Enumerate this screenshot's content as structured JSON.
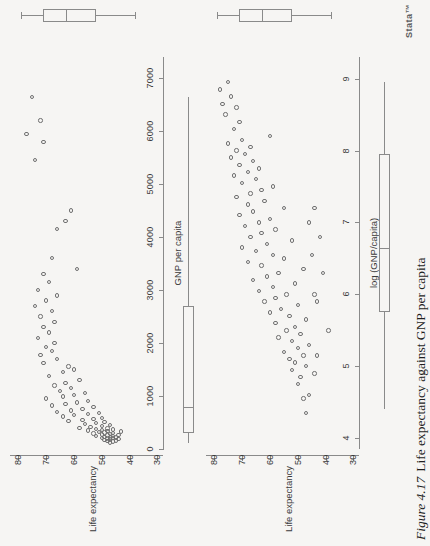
{
  "figure": {
    "number": "Figure 4.17",
    "caption": "Life expectancy against GNP per capita",
    "watermark": "Stata™",
    "orientation": "rotated-90-ccw",
    "background_color": "#f6f5f3",
    "ink_color": "#707070"
  },
  "chart_data": [
    {
      "id": "panel-raw",
      "type": "scatter",
      "title": "",
      "xlabel": "GNP per capita",
      "ylabel": "Life expectancy",
      "xlim": [
        0,
        7400
      ],
      "ylim": [
        28,
        83
      ],
      "xticks": [
        0,
        1000,
        2000,
        3000,
        4000,
        5000,
        6000,
        7000
      ],
      "xticklabels": [
        "0",
        "1000",
        "2000",
        "3000",
        "4000",
        "5000",
        "6000",
        "7000"
      ],
      "yticks": [
        30,
        40,
        50,
        60,
        70,
        80
      ],
      "yticklabels": [
        "30",
        "40",
        "50",
        "60",
        "70",
        "80"
      ],
      "grid": false,
      "legend": "none",
      "marker": "open-circle",
      "points": [
        [
          120,
          47
        ],
        [
          140,
          46
        ],
        [
          150,
          48
        ],
        [
          160,
          45
        ],
        [
          170,
          49
        ],
        [
          180,
          47
        ],
        [
          190,
          44
        ],
        [
          200,
          48
        ],
        [
          205,
          46
        ],
        [
          210,
          50
        ],
        [
          215,
          47
        ],
        [
          220,
          45
        ],
        [
          230,
          49
        ],
        [
          240,
          46
        ],
        [
          250,
          52
        ],
        [
          255,
          48
        ],
        [
          260,
          44
        ],
        [
          270,
          50
        ],
        [
          280,
          47
        ],
        [
          290,
          53
        ],
        [
          300,
          46
        ],
        [
          310,
          49
        ],
        [
          320,
          51
        ],
        [
          330,
          43
        ],
        [
          340,
          48
        ],
        [
          350,
          55
        ],
        [
          360,
          50
        ],
        [
          370,
          46
        ],
        [
          380,
          52
        ],
        [
          390,
          48
        ],
        [
          400,
          58
        ],
        [
          420,
          54
        ],
        [
          430,
          50
        ],
        [
          450,
          47
        ],
        [
          470,
          56
        ],
        [
          490,
          52
        ],
        [
          510,
          49
        ],
        [
          530,
          62
        ],
        [
          550,
          57
        ],
        [
          570,
          53
        ],
        [
          590,
          50
        ],
        [
          610,
          64
        ],
        [
          640,
          60
        ],
        [
          660,
          55
        ],
        [
          680,
          51
        ],
        [
          700,
          66
        ],
        [
          730,
          61
        ],
        [
          760,
          57
        ],
        [
          790,
          53
        ],
        [
          820,
          68
        ],
        [
          850,
          63
        ],
        [
          880,
          59
        ],
        [
          910,
          55
        ],
        [
          950,
          70
        ],
        [
          990,
          64
        ],
        [
          1020,
          60
        ],
        [
          1060,
          56
        ],
        [
          1100,
          65
        ],
        [
          1150,
          61
        ],
        [
          1200,
          67
        ],
        [
          1250,
          63
        ],
        [
          1300,
          58
        ],
        [
          1380,
          69
        ],
        [
          1450,
          64
        ],
        [
          1500,
          60
        ],
        [
          1560,
          62
        ],
        [
          1620,
          71
        ],
        [
          1700,
          66
        ],
        [
          1780,
          72
        ],
        [
          1850,
          68
        ],
        [
          1920,
          70
        ],
        [
          2000,
          67
        ],
        [
          2100,
          73
        ],
        [
          2200,
          69
        ],
        [
          2300,
          71
        ],
        [
          2400,
          67
        ],
        [
          2500,
          72
        ],
        [
          2600,
          68
        ],
        [
          2700,
          74
        ],
        [
          2800,
          70
        ],
        [
          2900,
          66
        ],
        [
          3000,
          73
        ],
        [
          3150,
          69
        ],
        [
          3300,
          71
        ],
        [
          3400,
          59
        ],
        [
          3600,
          68
        ],
        [
          4150,
          66
        ],
        [
          4300,
          63
        ],
        [
          4500,
          61
        ],
        [
          5450,
          74
        ],
        [
          5800,
          71
        ],
        [
          5950,
          77
        ],
        [
          6200,
          72
        ],
        [
          6650,
          75
        ]
      ],
      "boxplot_x": {
        "label": "GNP per capita",
        "min": 110,
        "q1": 310,
        "median": 790,
        "q3": 2700,
        "max": 6650
      },
      "boxplot_y": {
        "label": "Life expectancy",
        "min": 38,
        "q1": 52,
        "median": 63,
        "q3": 71,
        "max": 79
      }
    },
    {
      "id": "panel-log",
      "type": "scatter",
      "title": "",
      "xlabel": "log (GNP/capita)",
      "ylabel": "Life expectancy",
      "xlim": [
        3.85,
        9.3
      ],
      "ylim": [
        28,
        83
      ],
      "xticks": [
        4,
        5,
        6,
        7,
        8,
        9
      ],
      "xticklabels": [
        "4",
        "5",
        "6",
        "7",
        "8",
        "9"
      ],
      "yticks": [
        30,
        40,
        50,
        60,
        70,
        80
      ],
      "yticklabels": [
        "30",
        "40",
        "50",
        "60",
        "70",
        "80"
      ],
      "grid": false,
      "legend": "none",
      "marker": "open-circle",
      "points": [
        [
          4.35,
          47
        ],
        [
          4.55,
          48
        ],
        [
          4.6,
          46
        ],
        [
          4.75,
          50
        ],
        [
          4.85,
          49
        ],
        [
          4.95,
          52
        ],
        [
          5.0,
          47
        ],
        [
          5.05,
          51
        ],
        [
          5.1,
          53
        ],
        [
          5.15,
          48
        ],
        [
          5.2,
          55
        ],
        [
          5.25,
          50
        ],
        [
          5.3,
          46
        ],
        [
          5.35,
          52
        ],
        [
          5.4,
          57
        ],
        [
          5.45,
          49
        ],
        [
          5.5,
          54
        ],
        [
          5.55,
          51
        ],
        [
          5.6,
          58
        ],
        [
          5.65,
          47
        ],
        [
          5.7,
          53
        ],
        [
          5.75,
          60
        ],
        [
          5.8,
          56
        ],
        [
          5.85,
          50
        ],
        [
          5.9,
          62
        ],
        [
          5.95,
          58
        ],
        [
          6.0,
          54
        ],
        [
          6.05,
          64
        ],
        [
          6.1,
          59
        ],
        [
          6.15,
          51
        ],
        [
          6.2,
          66
        ],
        [
          6.25,
          61
        ],
        [
          6.3,
          57
        ],
        [
          6.35,
          48
        ],
        [
          6.4,
          63
        ],
        [
          6.45,
          68
        ],
        [
          6.5,
          55
        ],
        [
          6.55,
          59
        ],
        [
          6.6,
          65
        ],
        [
          6.65,
          70
        ],
        [
          6.7,
          61
        ],
        [
          6.75,
          52
        ],
        [
          6.8,
          67
        ],
        [
          6.85,
          63
        ],
        [
          6.9,
          58
        ],
        [
          6.95,
          69
        ],
        [
          7.0,
          64
        ],
        [
          7.05,
          60
        ],
        [
          7.1,
          71
        ],
        [
          7.15,
          66
        ],
        [
          7.2,
          55
        ],
        [
          7.25,
          68
        ],
        [
          7.3,
          62
        ],
        [
          7.35,
          72
        ],
        [
          7.4,
          67
        ],
        [
          7.45,
          63
        ],
        [
          7.5,
          59
        ],
        [
          7.55,
          70
        ],
        [
          7.6,
          65
        ],
        [
          7.65,
          73
        ],
        [
          7.7,
          68
        ],
        [
          7.75,
          64
        ],
        [
          7.8,
          71
        ],
        [
          7.85,
          66
        ],
        [
          7.9,
          74
        ],
        [
          7.95,
          69
        ],
        [
          8.0,
          72
        ],
        [
          8.05,
          67
        ],
        [
          8.1,
          75
        ],
        [
          8.15,
          70
        ],
        [
          8.2,
          60
        ],
        [
          8.3,
          73
        ],
        [
          8.4,
          71
        ],
        [
          8.5,
          76
        ],
        [
          8.6,
          72
        ],
        [
          8.65,
          77
        ],
        [
          8.75,
          74
        ],
        [
          8.85,
          78
        ],
        [
          8.95,
          75
        ],
        [
          5.5,
          39
        ],
        [
          5.9,
          43
        ],
        [
          6.0,
          44
        ],
        [
          6.3,
          41
        ],
        [
          6.55,
          45
        ],
        [
          6.8,
          42
        ],
        [
          7.0,
          46
        ],
        [
          7.2,
          44
        ],
        [
          4.9,
          44
        ],
        [
          5.15,
          43
        ]
      ],
      "boxplot_x": {
        "label": "log (GNP/capita)",
        "min": 4.4,
        "q1": 5.75,
        "median": 6.65,
        "q3": 7.95,
        "max": 8.95
      },
      "boxplot_y": {
        "label": "Life expectancy",
        "min": 38,
        "q1": 52,
        "median": 63,
        "q3": 71,
        "max": 79
      }
    }
  ]
}
